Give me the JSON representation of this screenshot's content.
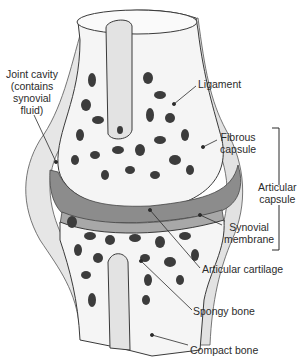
{
  "colors": {
    "bone_fill": "#f4f4f4",
    "outline": "#3a3a3a",
    "spongy_holes": "#3c3c3c",
    "cartilage": "#9a9a9a",
    "cavity": "#8a8a8a",
    "capsule": "#cfcfcf",
    "text": "#2b2b2b"
  },
  "labels": {
    "joint_cavity": [
      "Joint cavity",
      "(contains",
      "synovial",
      "fluid)"
    ],
    "ligament": "Ligament",
    "fibrous_capsule": [
      "Fibrous",
      "capsule"
    ],
    "articular_capsule": [
      "Articular",
      "capsule"
    ],
    "synovial_membrane": [
      "Synovial",
      "membrane"
    ],
    "articular_cartilage": "Articular cartilage",
    "spongy_bone": "Spongy bone",
    "compact_bone": "Compact bone"
  }
}
